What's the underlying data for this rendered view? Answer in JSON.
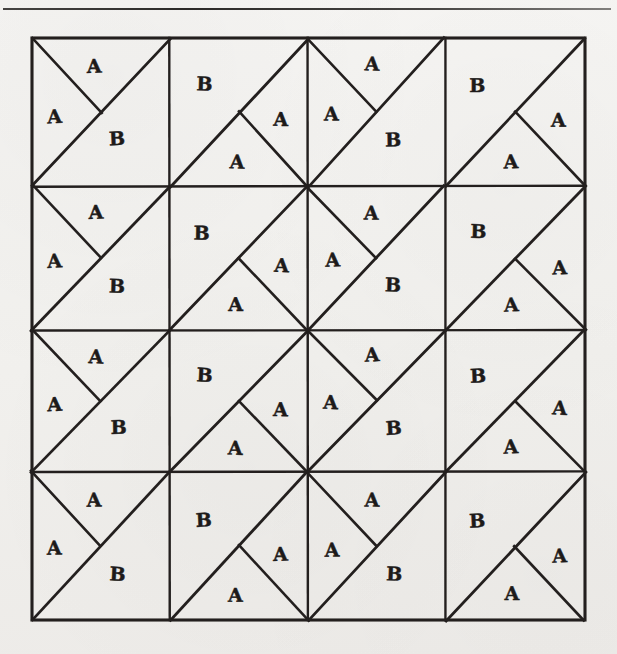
{
  "figure": {
    "background_color": "#f4f3f1",
    "ink_color": "#231f1e",
    "top_rule": {
      "name": "horizontal-rule",
      "x": 3,
      "y": 8,
      "width": 608,
      "height": 2
    },
    "grid": {
      "x": 32,
      "y": 38,
      "width": 553,
      "height": 582,
      "columns": 4,
      "rows": 4,
      "column_edges": [
        32,
        170,
        308,
        445,
        585
      ],
      "row_edges": [
        38,
        186,
        330,
        472,
        620
      ],
      "cell_width": 138,
      "cell_height": 145
    },
    "tile_types": {
      "type1": {
        "name": "tile-A-A-B-left-spur",
        "description": "Square split by the anti-diagonal from bottom-left to top-right, plus a spur from the top-left corner to the centre of that diagonal.",
        "diagonal": "bottom-left to top-right",
        "spur_from": "top-left corner",
        "labels": [
          {
            "text": "A",
            "x_pct": 46,
            "y_pct": 19
          },
          {
            "text": "A",
            "x_pct": 17,
            "y_pct": 53
          },
          {
            "text": "B",
            "x_pct": 62,
            "y_pct": 70
          }
        ]
      },
      "type2": {
        "name": "tile-B-A-A-right-spur",
        "description": "Square split by the anti-diagonal from bottom-left to top-right, plus a spur from the bottom-right corner to the centre of that diagonal.",
        "diagonal": "bottom-left to top-right",
        "spur_from": "bottom-right corner",
        "labels": [
          {
            "text": "B",
            "x_pct": 24,
            "y_pct": 33
          },
          {
            "text": "A",
            "x_pct": 81,
            "y_pct": 57
          },
          {
            "text": "A",
            "x_pct": 48,
            "y_pct": 84
          }
        ]
      }
    },
    "layout": [
      [
        "type1",
        "type2",
        "type1",
        "type2"
      ],
      [
        "type1",
        "type2",
        "type1",
        "type2"
      ],
      [
        "type1",
        "type2",
        "type1",
        "type2"
      ],
      [
        "type1",
        "type2",
        "type1",
        "type2"
      ]
    ],
    "legend": {
      "label_a": "A",
      "label_b": "B",
      "tile_count": 16,
      "regions_per_tile": 3,
      "total_a_regions": 32,
      "total_b_regions": 16
    }
  }
}
